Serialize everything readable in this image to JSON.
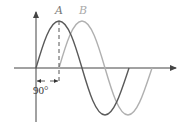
{
  "diagram": {
    "title": "",
    "curves": [
      {
        "label": "A",
        "color": "#5a5a5a",
        "phase_deg": 0
      },
      {
        "label": "B",
        "color": "#b0b0b0",
        "phase_deg": 90
      }
    ],
    "phase_label": "90°",
    "axis_color": "#444444"
  }
}
